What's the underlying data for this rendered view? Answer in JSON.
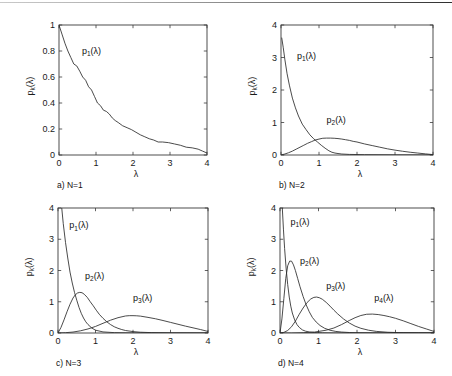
{
  "figure": {
    "background_color": "#ffffff",
    "ink_color": "#2b2b2b",
    "top_rule": true,
    "lambda_symbol": "λ",
    "ylabel_text": "p",
    "ylabel_sub": "k",
    "ylabel_arg": "(λ)"
  },
  "chart_data": [
    {
      "type": "line",
      "panel": "a",
      "caption": "a) N=1",
      "title": "",
      "xlabel": "λ",
      "ylabel": "p_k(λ)",
      "xlim": [
        0,
        4
      ],
      "ylim": [
        0,
        1
      ],
      "xticks": [
        0,
        1,
        2,
        3,
        4
      ],
      "xticklabels": [
        "0",
        "1",
        "2",
        "3",
        "4"
      ],
      "yticks": [
        0,
        0.2,
        0.4,
        0.6,
        0.8,
        1
      ],
      "yticklabels": [
        "0",
        "0.2",
        "0.4",
        "0.6",
        "0.8",
        "1"
      ],
      "grid": false,
      "legend": "inline-annotations",
      "series": [
        {
          "name": "p_1(λ)",
          "label_base": "p",
          "label_sub": "1",
          "label_arg": "(λ)",
          "label_at": [
            0.62,
            0.78
          ],
          "x": [
            0,
            0.08,
            0.16,
            0.24,
            0.32,
            0.4,
            0.48,
            0.56,
            0.64,
            0.72,
            0.8,
            0.88,
            0.96,
            1.04,
            1.12,
            1.2,
            1.28,
            1.36,
            1.44,
            1.52,
            1.6,
            1.72,
            1.84,
            1.96,
            2.08,
            2.2,
            2.32,
            2.44,
            2.56,
            2.68,
            2.8,
            2.96,
            3.12,
            3.28,
            3.44,
            3.6,
            3.76,
            3.88,
            4
          ],
          "y": [
            1.0,
            0.93,
            0.86,
            0.8,
            0.75,
            0.7,
            0.685,
            0.645,
            0.6,
            0.575,
            0.525,
            0.5,
            0.45,
            0.4,
            0.38,
            0.345,
            0.335,
            0.315,
            0.285,
            0.265,
            0.25,
            0.225,
            0.21,
            0.195,
            0.175,
            0.155,
            0.14,
            0.125,
            0.115,
            0.1,
            0.1,
            0.095,
            0.085,
            0.075,
            0.06,
            0.055,
            0.045,
            0.03,
            0.015
          ]
        }
      ]
    },
    {
      "type": "line",
      "panel": "b",
      "caption": "b) N=2",
      "title": "",
      "xlabel": "λ",
      "ylabel": "p_k(λ)",
      "xlim": [
        0,
        4
      ],
      "ylim": [
        0,
        4
      ],
      "xticks": [
        0,
        1,
        2,
        3,
        4
      ],
      "xticklabels": [
        "0",
        "1",
        "2",
        "3",
        "4"
      ],
      "yticks": [
        0,
        1,
        2,
        3,
        4
      ],
      "yticklabels": [
        "0",
        "1",
        "2",
        "3",
        "4"
      ],
      "grid": false,
      "legend": "inline-annotations",
      "series": [
        {
          "name": "p_1(λ)",
          "label_base": "p",
          "label_sub": "1",
          "label_arg": "(λ)",
          "label_at": [
            0.42,
            2.95
          ],
          "x": [
            0.02,
            0.06,
            0.1,
            0.16,
            0.22,
            0.3,
            0.38,
            0.46,
            0.56,
            0.66,
            0.76,
            0.86,
            0.96,
            1.06,
            1.16,
            1.26,
            1.34,
            1.42,
            1.5,
            1.6,
            1.8,
            2.2,
            3.0,
            4.0
          ],
          "y": [
            3.6,
            3.3,
            2.95,
            2.5,
            2.15,
            1.75,
            1.45,
            1.2,
            0.95,
            0.78,
            0.62,
            0.5,
            0.4,
            0.3,
            0.21,
            0.13,
            0.085,
            0.06,
            0.045,
            0.03,
            0.018,
            0.01,
            0.005,
            0.002
          ]
        },
        {
          "name": "p_2(λ)",
          "label_base": "p",
          "label_sub": "2",
          "label_arg": "(λ)",
          "label_at": [
            1.2,
            1.0
          ],
          "x": [
            0.0,
            0.1,
            0.2,
            0.3,
            0.4,
            0.5,
            0.6,
            0.7,
            0.8,
            0.9,
            1.0,
            1.1,
            1.2,
            1.3,
            1.4,
            1.5,
            1.6,
            1.7,
            1.8,
            1.9,
            2.0,
            2.2,
            2.4,
            2.6,
            2.8,
            3.0,
            3.2,
            3.4,
            3.6,
            3.8,
            4.0
          ],
          "y": [
            0.0,
            0.03,
            0.07,
            0.12,
            0.18,
            0.24,
            0.3,
            0.36,
            0.41,
            0.46,
            0.49,
            0.515,
            0.52,
            0.52,
            0.515,
            0.505,
            0.49,
            0.47,
            0.45,
            0.42,
            0.4,
            0.34,
            0.29,
            0.24,
            0.19,
            0.15,
            0.115,
            0.085,
            0.06,
            0.035,
            0.012
          ]
        }
      ]
    },
    {
      "type": "line",
      "panel": "c",
      "caption": "c) N=3",
      "title": "",
      "xlabel": "λ",
      "ylabel": "p_k(λ)",
      "xlim": [
        0,
        4
      ],
      "ylim": [
        0,
        4
      ],
      "xticks": [
        0,
        1,
        2,
        3,
        4
      ],
      "xticklabels": [
        "0",
        "1",
        "2",
        "3",
        "4"
      ],
      "yticks": [
        0,
        1,
        2,
        3,
        4
      ],
      "yticklabels": [
        "0",
        "1",
        "2",
        "3",
        "4"
      ],
      "grid": false,
      "legend": "inline-annotations",
      "series": [
        {
          "name": "p_1(λ)",
          "label_base": "p",
          "label_sub": "1",
          "label_arg": "(λ)",
          "label_at": [
            0.3,
            3.35
          ],
          "x": [
            0.1,
            0.14,
            0.2,
            0.26,
            0.32,
            0.38,
            0.44,
            0.5,
            0.56,
            0.62,
            0.68,
            0.74,
            0.8,
            0.9,
            1.0,
            1.2,
            1.5,
            2.0,
            3.0,
            4.0
          ],
          "y": [
            4.0,
            3.5,
            2.9,
            2.4,
            1.95,
            1.6,
            1.3,
            1.05,
            0.82,
            0.63,
            0.48,
            0.36,
            0.27,
            0.16,
            0.09,
            0.035,
            0.012,
            0.004,
            0.001,
            0.0
          ]
        },
        {
          "name": "p_2(λ)",
          "label_base": "p",
          "label_sub": "2",
          "label_arg": "(λ)",
          "label_at": [
            0.72,
            1.72
          ],
          "x": [
            0.0,
            0.08,
            0.16,
            0.24,
            0.32,
            0.4,
            0.46,
            0.52,
            0.58,
            0.64,
            0.7,
            0.78,
            0.86,
            0.94,
            1.02,
            1.1,
            1.2,
            1.3,
            1.4,
            1.5,
            1.6,
            1.7,
            1.8,
            2.0,
            2.2,
            2.5,
            3.0,
            4.0
          ],
          "y": [
            0.0,
            0.18,
            0.42,
            0.68,
            0.92,
            1.12,
            1.22,
            1.28,
            1.3,
            1.29,
            1.24,
            1.14,
            1.0,
            0.87,
            0.73,
            0.6,
            0.47,
            0.36,
            0.27,
            0.2,
            0.15,
            0.11,
            0.08,
            0.045,
            0.025,
            0.012,
            0.004,
            0.001
          ]
        },
        {
          "name": "p_3(λ)",
          "label_base": "p",
          "label_sub": "3",
          "label_arg": "(λ)",
          "label_at": [
            2.0,
            1.02
          ],
          "x": [
            0.0,
            0.2,
            0.4,
            0.6,
            0.8,
            1.0,
            1.2,
            1.4,
            1.6,
            1.8,
            1.9,
            2.0,
            2.1,
            2.2,
            2.4,
            2.6,
            2.8,
            3.0,
            3.2,
            3.4,
            3.6,
            3.8,
            4.0
          ],
          "y": [
            0.0,
            0.01,
            0.03,
            0.07,
            0.13,
            0.21,
            0.31,
            0.41,
            0.49,
            0.545,
            0.555,
            0.555,
            0.55,
            0.54,
            0.5,
            0.455,
            0.4,
            0.34,
            0.28,
            0.22,
            0.165,
            0.11,
            0.05
          ]
        }
      ]
    },
    {
      "type": "line",
      "panel": "d",
      "caption": "d) N=4",
      "title": "",
      "xlabel": "λ",
      "ylabel": "p_k(λ)",
      "xlim": [
        0,
        4
      ],
      "ylim": [
        0,
        4
      ],
      "xticks": [
        0,
        1,
        2,
        3,
        4
      ],
      "xticklabels": [
        "0",
        "1",
        "2",
        "3",
        "4"
      ],
      "yticks": [
        0,
        1,
        2,
        3,
        4
      ],
      "yticklabels": [
        "0",
        "1",
        "2",
        "3",
        "4"
      ],
      "grid": false,
      "legend": "inline-annotations",
      "series": [
        {
          "name": "p_1(λ)",
          "label_base": "p",
          "label_sub": "1",
          "label_arg": "(λ)",
          "label_at": [
            0.27,
            3.45
          ],
          "x": [
            0.06,
            0.09,
            0.12,
            0.16,
            0.2,
            0.24,
            0.28,
            0.32,
            0.38,
            0.44,
            0.5,
            0.58,
            0.66,
            0.76,
            0.9,
            1.1,
            1.4,
            2.0,
            3.0,
            4.0
          ],
          "y": [
            4.0,
            3.3,
            2.7,
            2.05,
            1.55,
            1.15,
            0.86,
            0.64,
            0.42,
            0.27,
            0.18,
            0.1,
            0.06,
            0.032,
            0.015,
            0.006,
            0.002,
            0.0,
            0.0,
            0.0
          ]
        },
        {
          "name": "p_2(λ)",
          "label_base": "p",
          "label_sub": "2",
          "label_arg": "(λ)",
          "label_at": [
            0.52,
            2.22
          ],
          "x": [
            0.0,
            0.05,
            0.1,
            0.15,
            0.2,
            0.25,
            0.3,
            0.35,
            0.4,
            0.46,
            0.52,
            0.6,
            0.68,
            0.76,
            0.84,
            0.94,
            1.04,
            1.16,
            1.3,
            1.45,
            1.6,
            1.8,
            2.0,
            2.4,
            3.0,
            4.0
          ],
          "y": [
            0.0,
            0.45,
            1.1,
            1.75,
            2.15,
            2.3,
            2.3,
            2.18,
            2.0,
            1.74,
            1.48,
            1.17,
            0.9,
            0.68,
            0.5,
            0.35,
            0.24,
            0.15,
            0.088,
            0.05,
            0.03,
            0.015,
            0.008,
            0.003,
            0.001,
            0.0
          ]
        },
        {
          "name": "p_3(λ)",
          "label_base": "p",
          "label_sub": "3",
          "label_arg": "(λ)",
          "label_at": [
            1.2,
            1.42
          ],
          "x": [
            0.0,
            0.1,
            0.2,
            0.3,
            0.4,
            0.5,
            0.6,
            0.7,
            0.8,
            0.88,
            0.95,
            1.02,
            1.1,
            1.2,
            1.3,
            1.4,
            1.5,
            1.65,
            1.8,
            1.95,
            2.1,
            2.3,
            2.5,
            2.8,
            3.2,
            3.6,
            4.0
          ],
          "y": [
            0.0,
            0.02,
            0.08,
            0.2,
            0.38,
            0.6,
            0.8,
            0.97,
            1.09,
            1.14,
            1.15,
            1.13,
            1.08,
            0.98,
            0.86,
            0.73,
            0.61,
            0.45,
            0.32,
            0.22,
            0.15,
            0.09,
            0.052,
            0.024,
            0.009,
            0.004,
            0.002
          ]
        },
        {
          "name": "p_4(λ)",
          "label_base": "p",
          "label_sub": "4",
          "label_arg": "(λ)",
          "label_at": [
            2.45,
            1.02
          ],
          "x": [
            0.0,
            0.3,
            0.6,
            0.9,
            1.2,
            1.4,
            1.6,
            1.8,
            1.95,
            2.1,
            2.25,
            2.4,
            2.55,
            2.7,
            2.85,
            3.0,
            3.2,
            3.4,
            3.6,
            3.8,
            4.0
          ],
          "y": [
            0.0,
            0.0,
            0.01,
            0.03,
            0.09,
            0.16,
            0.27,
            0.4,
            0.49,
            0.56,
            0.6,
            0.605,
            0.59,
            0.56,
            0.52,
            0.47,
            0.39,
            0.3,
            0.21,
            0.13,
            0.05
          ]
        }
      ]
    }
  ],
  "panel_geometry": [
    {
      "key": "a",
      "left": 0,
      "top": 0,
      "plot_x": 59,
      "plot_y": 25,
      "plot_w": 148,
      "plot_h": 130
    },
    {
      "key": "b",
      "left": 226,
      "top": 0,
      "plot_x": 55,
      "plot_y": 25,
      "plot_w": 152,
      "plot_h": 130
    },
    {
      "key": "c",
      "left": 0,
      "top": 188,
      "plot_x": 58,
      "plot_y": 20,
      "plot_w": 150,
      "plot_h": 125
    },
    {
      "key": "d",
      "left": 226,
      "top": 188,
      "plot_x": 54,
      "plot_y": 20,
      "plot_w": 154,
      "plot_h": 125
    }
  ]
}
